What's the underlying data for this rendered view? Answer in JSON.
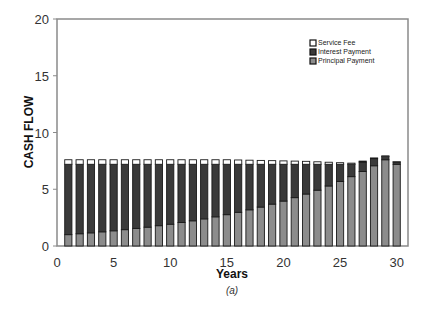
{
  "chart_data": {
    "type": "bar",
    "stacked": true,
    "title": "",
    "caption": "(a)",
    "xlabel": "Years",
    "ylabel": "CASH FLOW",
    "xlim": [
      0,
      31
    ],
    "ylim": [
      0,
      20
    ],
    "x_ticks": [
      0,
      5,
      10,
      15,
      20,
      25,
      30
    ],
    "y_ticks": [
      0,
      5,
      10,
      15,
      20
    ],
    "grid": false,
    "legend_position": "upper right (inside)",
    "categories": [
      1,
      2,
      3,
      4,
      5,
      6,
      7,
      8,
      9,
      10,
      11,
      12,
      13,
      14,
      15,
      16,
      17,
      18,
      19,
      20,
      21,
      22,
      23,
      24,
      25,
      26,
      27,
      28,
      29,
      30
    ],
    "series": [
      {
        "name": "Principal Payment",
        "color": "#8c8c8c",
        "values": [
          1.0,
          1.08,
          1.16,
          1.25,
          1.34,
          1.44,
          1.55,
          1.66,
          1.79,
          1.92,
          2.07,
          2.22,
          2.39,
          2.57,
          2.76,
          2.97,
          3.19,
          3.43,
          3.69,
          3.96,
          4.26,
          4.58,
          4.92,
          5.29,
          5.69,
          6.11,
          6.57,
          7.07,
          7.6,
          7.2
        ]
      },
      {
        "name": "Interest Payment",
        "color": "#3a3a3a",
        "values": [
          6.2,
          6.12,
          6.04,
          5.95,
          5.86,
          5.76,
          5.65,
          5.54,
          5.41,
          5.28,
          5.13,
          4.98,
          4.81,
          4.63,
          4.44,
          4.23,
          4.01,
          3.77,
          3.51,
          3.24,
          2.94,
          2.62,
          2.28,
          1.91,
          1.51,
          1.09,
          0.83,
          0.63,
          0.3,
          0.2
        ]
      },
      {
        "name": "Service Fee",
        "color": "#ffffff",
        "values": [
          0.4,
          0.4,
          0.4,
          0.4,
          0.4,
          0.4,
          0.4,
          0.4,
          0.4,
          0.4,
          0.4,
          0.4,
          0.4,
          0.4,
          0.4,
          0.38,
          0.36,
          0.34,
          0.32,
          0.3,
          0.28,
          0.26,
          0.22,
          0.18,
          0.14,
          0.1,
          0.08,
          0.06,
          0.04,
          0.02
        ]
      }
    ]
  },
  "legend": {
    "items": [
      {
        "label": "Service Fee",
        "color": "#ffffff"
      },
      {
        "label": "Interest Payment",
        "color": "#3a3a3a"
      },
      {
        "label": "Principal Payment",
        "color": "#8c8c8c"
      }
    ]
  }
}
